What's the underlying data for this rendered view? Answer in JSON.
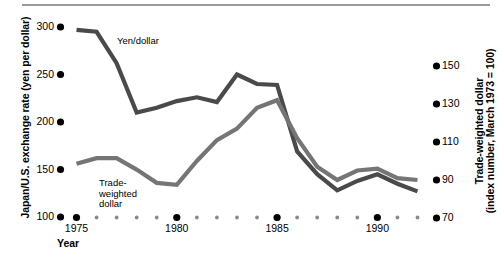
{
  "chart_data": {
    "type": "line",
    "title": "",
    "xlabel": "Year",
    "ylabel": "Japan/U.S. exchange rate (yen per dollar)",
    "y2label": "Trade-weighted dollar (index number, March 1973 = 100)",
    "y2label_line1": "Trade-weighted dollar",
    "y2label_line2": "(index number, March 1973 = 100)",
    "xlim": [
      1975,
      1992.5
    ],
    "ylim": [
      100,
      310
    ],
    "y2lim": [
      70,
      155
    ],
    "grid": false,
    "legend_position": "inline-annotations",
    "yticks": [
      100,
      150,
      200,
      250,
      300
    ],
    "ytick_labels": [
      "100",
      "150",
      "200",
      "250",
      "300"
    ],
    "y2ticks": [
      70,
      90,
      110,
      130,
      150
    ],
    "y2tick_labels": [
      "70",
      "90",
      "110",
      "130",
      "150"
    ],
    "xticks_major": [
      1975,
      1980,
      1985,
      1990
    ],
    "xtick_labels": [
      "1975",
      "1980",
      "1985",
      "1990"
    ],
    "xticks_minor": [
      1976,
      1977,
      1978,
      1979,
      1981,
      1982,
      1983,
      1984,
      1986,
      1987,
      1988,
      1989,
      1991,
      1992
    ],
    "series": [
      {
        "name": "Yen/dollar",
        "axis": "left",
        "color": "#4a4a4a",
        "label_position": {
          "x": 117,
          "y": 36
        },
        "x": [
          1975,
          1976,
          1977,
          1978,
          1979,
          1980,
          1981,
          1982,
          1983,
          1984,
          1985,
          1986,
          1987,
          1988,
          1989,
          1990,
          1991,
          1992
        ],
        "values": [
          297,
          295,
          262,
          210,
          215,
          222,
          226,
          221,
          250,
          240,
          239,
          169,
          145,
          128,
          138,
          145,
          135,
          127
        ]
      },
      {
        "name": "Trade-weighted dollar",
        "axis": "right",
        "color": "#757575",
        "label_line1": "Trade-",
        "label_line2": "weighted",
        "label_line3": "dollar",
        "label_position": {
          "x": 99,
          "y": 178
        },
        "x": [
          1975,
          1976,
          1977,
          1978,
          1979,
          1980,
          1981,
          1982,
          1983,
          1984,
          1985,
          1986,
          1987,
          1988,
          1989,
          1990,
          1991,
          1992
        ],
        "values": [
          98.5,
          101.5,
          101.5,
          95.5,
          88.5,
          87.5,
          100,
          111,
          117,
          128,
          132,
          112,
          97,
          90,
          95,
          96,
          91,
          90
        ]
      }
    ]
  },
  "axes": {
    "left_title": "Japan/U.S. exchange rate (yen per dollar)",
    "right_title_line1": "Trade-weighted dollar",
    "right_title_line2": "(index number, March 1973 = 100)",
    "x_title": "Year"
  }
}
